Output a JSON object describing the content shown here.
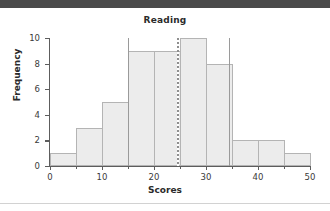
{
  "window": {
    "header_bar_color": "#4a4a4a",
    "background_color": "#ffffff"
  },
  "chart_data": {
    "type": "bar",
    "title": "Reading",
    "xlabel": "Scores",
    "ylabel": "Frequency",
    "bin_width": 5,
    "bin_edges": [
      0,
      5,
      10,
      15,
      20,
      25,
      30,
      35,
      40,
      45,
      50
    ],
    "categories": [
      "0-5",
      "5-10",
      "10-15",
      "15-20",
      "20-25",
      "25-30",
      "30-35",
      "35-40",
      "40-45",
      "45-50"
    ],
    "values": [
      1,
      3,
      5,
      9,
      9,
      10,
      8,
      2,
      2,
      1
    ],
    "xlim": [
      0,
      50
    ],
    "ylim": [
      0,
      10
    ],
    "xticks": [
      0,
      10,
      20,
      30,
      40,
      50
    ],
    "xticks_minor": [
      5,
      15,
      25,
      35,
      45
    ],
    "yticks": [
      0,
      2,
      4,
      6,
      8,
      10
    ],
    "grid": false,
    "legend": null,
    "bar_fill_color": "#ececec",
    "bar_edge_color": "#b4b4b4",
    "reference_lines": [
      {
        "name": "lower-reference-line",
        "x": 15,
        "style": "solid",
        "color": "#9a9a9a"
      },
      {
        "name": "mean-reference-line",
        "x": 24.5,
        "style": "dashed",
        "color": "#8f8f8f"
      },
      {
        "name": "upper-reference-line",
        "x": 34.5,
        "style": "solid",
        "color": "#9a9a9a"
      }
    ]
  }
}
